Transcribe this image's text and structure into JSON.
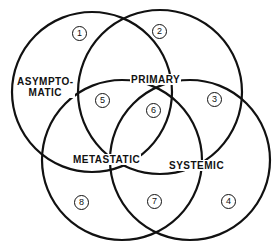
{
  "diagram": {
    "type": "venn",
    "sets": [
      {
        "id": "asymptomatic",
        "label": "ASYMPTO-\nMATIC",
        "line1": "ASYMPTO-",
        "line2": "MATIC"
      },
      {
        "id": "primary",
        "label": "PRIMARY"
      },
      {
        "id": "metastatic",
        "label": "METASTATIC"
      },
      {
        "id": "systemic",
        "label": "SYSTEMIC"
      }
    ],
    "regions": [
      {
        "n": "1",
        "sets": [
          "asymptomatic"
        ]
      },
      {
        "n": "2",
        "sets": [
          "primary"
        ]
      },
      {
        "n": "3",
        "sets": [
          "primary",
          "systemic"
        ]
      },
      {
        "n": "4",
        "sets": [
          "systemic"
        ]
      },
      {
        "n": "5",
        "sets": [
          "asymptomatic",
          "primary",
          "metastatic"
        ]
      },
      {
        "n": "6",
        "sets": [
          "primary",
          "metastatic",
          "systemic"
        ]
      },
      {
        "n": "7",
        "sets": [
          "metastatic",
          "systemic"
        ]
      },
      {
        "n": "8",
        "sets": [
          "metastatic"
        ]
      }
    ],
    "line_color": "#111111",
    "background": "#ffffff"
  }
}
